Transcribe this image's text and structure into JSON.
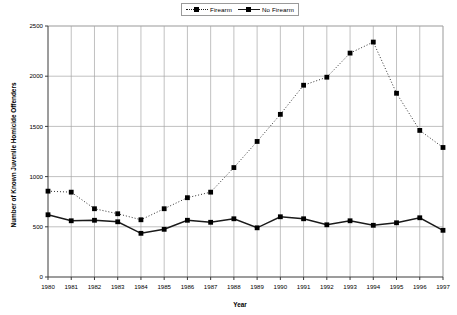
{
  "legend": {
    "position": "top-center",
    "entries": [
      {
        "label": "Firearm",
        "style": "dotted",
        "marker": "square"
      },
      {
        "label": "No Firearm",
        "style": "solid",
        "marker": "square"
      }
    ]
  },
  "chart_data": {
    "type": "line",
    "title": "",
    "xlabel": "Year",
    "ylabel": "Number of Known Juvenile Homicide Offenders",
    "x": [
      1980,
      1981,
      1982,
      1983,
      1984,
      1985,
      1986,
      1987,
      1988,
      1989,
      1990,
      1991,
      1992,
      1993,
      1994,
      1995,
      1996,
      1997
    ],
    "categories": [
      "1980",
      "1981",
      "1982",
      "1983",
      "1984",
      "1985",
      "1986",
      "1987",
      "1988",
      "1989",
      "1990",
      "1991",
      "1992",
      "1993",
      "1994",
      "1995",
      "1996",
      "1997"
    ],
    "series": [
      {
        "name": "Firearm",
        "style": "dotted",
        "values": [
          855,
          845,
          680,
          630,
          570,
          680,
          790,
          845,
          1090,
          1350,
          1620,
          1910,
          1990,
          2230,
          2340,
          1830,
          1460,
          1290
        ]
      },
      {
        "name": "No Firearm",
        "style": "solid",
        "values": [
          620,
          560,
          565,
          550,
          435,
          475,
          565,
          545,
          580,
          490,
          600,
          580,
          520,
          560,
          515,
          540,
          590,
          465
        ]
      }
    ],
    "ylim": [
      0,
      2500
    ],
    "yticks": [
      0,
      500,
      1000,
      1500,
      2000,
      2500
    ],
    "ytick_labels": [
      "0",
      "500",
      "1000",
      "1500",
      "2000",
      "2500"
    ],
    "xlim": [
      1980,
      1997
    ],
    "grid": {
      "horizontal": true,
      "vertical": true,
      "color": "#a6a6a6"
    },
    "legend_position": "top-center"
  },
  "colors": {
    "line": "#1a1a1a",
    "marker": "#000000",
    "grid": "#a6a6a6",
    "axis": "#3a3a3a",
    "background": "#ffffff"
  }
}
